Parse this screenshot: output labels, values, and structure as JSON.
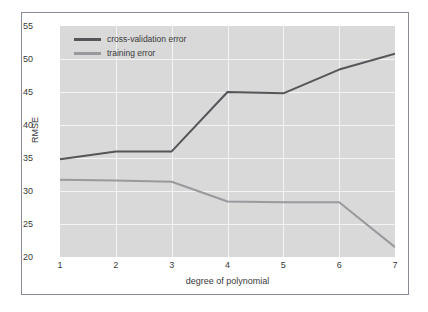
{
  "chart_data": {
    "type": "line",
    "title": "",
    "xlabel": "degree of polynomial",
    "ylabel": "RMSE",
    "x": [
      1,
      2,
      3,
      4,
      5,
      6,
      7
    ],
    "xticklabels": [
      "1",
      "2",
      "3",
      "4",
      "5",
      "6",
      "7"
    ],
    "yticklabels": [
      "20",
      "25",
      "30",
      "35",
      "40",
      "45",
      "50",
      "55"
    ],
    "yticks": [
      20,
      25,
      30,
      35,
      40,
      45,
      50,
      55
    ],
    "xlim": [
      1,
      7
    ],
    "ylim": [
      20,
      55
    ],
    "grid": true,
    "legend_position": "upper left",
    "series": [
      {
        "name": "cross-validation error",
        "color": "#55555a",
        "values": [
          34.8,
          36.0,
          36.0,
          45.0,
          44.8,
          48.4,
          50.8
        ]
      },
      {
        "name": "training error",
        "color": "#99999e",
        "values": [
          31.7,
          31.6,
          31.4,
          28.4,
          28.3,
          28.3,
          21.5
        ]
      }
    ]
  },
  "legend": {
    "items": [
      {
        "label": "cross-validation error",
        "color": "#55555a"
      },
      {
        "label": "training error",
        "color": "#99999e"
      }
    ]
  },
  "colors": {
    "plot_background": "#d9d9d9",
    "gridline": "#f4f4f4",
    "figure_border": "#8a8a97",
    "tick_text": "#3a3a3a"
  }
}
